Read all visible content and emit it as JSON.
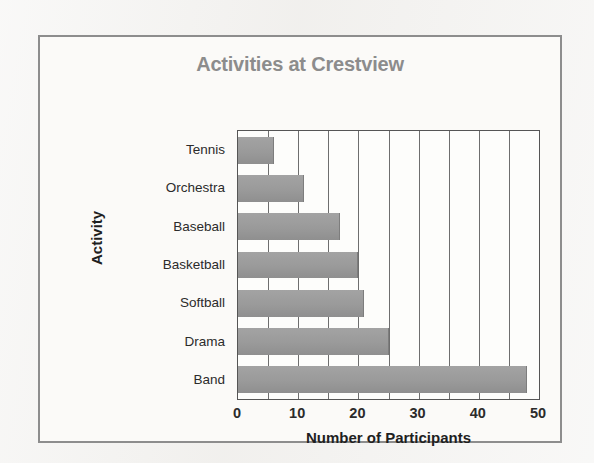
{
  "chart_data": {
    "type": "bar",
    "orientation": "horizontal",
    "title": "Activities at Crestview",
    "xlabel": "Number of Participants",
    "ylabel": "Activity",
    "categories": [
      "Tennis",
      "Orchestra",
      "Baseball",
      "Basketball",
      "Softball",
      "Drama",
      "Band"
    ],
    "values": [
      6,
      11,
      17,
      20,
      21,
      25,
      48
    ],
    "xlim": [
      0,
      50
    ],
    "xticks": [
      0,
      10,
      20,
      30,
      40,
      50
    ],
    "xtick_labels": [
      "0",
      "10",
      "20",
      "30",
      "40",
      "50"
    ],
    "minor_gridline_step": 5,
    "grid": true,
    "grid_axis": "x",
    "legend": false,
    "bar_color": "#9a9a9a",
    "title_color": "#8c8c8c",
    "axis_text_color": "#1f1f1f",
    "frame_color": "#8d8d8d",
    "background": "#f2f1ef"
  }
}
